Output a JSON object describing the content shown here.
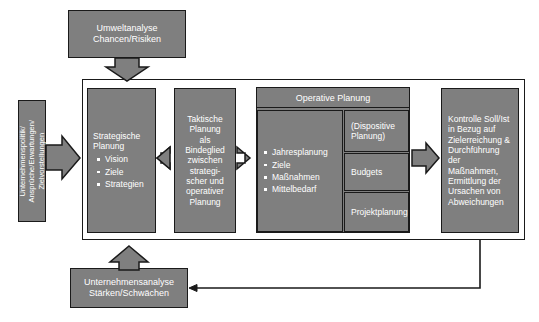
{
  "diagram": {
    "title_top": "Umweltanalyse Chancen/Risiken",
    "top_box": {
      "line1": "Umweltanalyse",
      "line2": "Chancen/Risiken"
    },
    "left_vertical_box": {
      "line1": "Unternehmenspolitik/",
      "line2": "Ansprüche/Erwartungen/",
      "line3": "Zielvorstellungen"
    },
    "strategic_box": {
      "heading_line1": "Strategische",
      "heading_line2": "Planung",
      "bullets": [
        "Vision",
        "Ziele",
        "Strategien"
      ]
    },
    "tactical_box": {
      "lines": [
        "Taktische",
        "Planung",
        "als",
        "Bindeglied",
        "zwischen",
        "strategi-",
        "scher und",
        "operativer",
        "Planung"
      ]
    },
    "operative": {
      "header": "Operative Planung",
      "bullets": [
        "Jahresplanung",
        "Ziele",
        "Maßnahmen",
        "Mittelbedarf"
      ],
      "side_boxes": [
        {
          "line1": "(Dispositive",
          "line2": "Planung)"
        },
        {
          "line1": "Budgets",
          "line2": ""
        },
        {
          "line1": "Projektplanung",
          "line2": ""
        }
      ]
    },
    "control_box": {
      "lines": [
        "Kontrolle Soll/Ist",
        "in Bezug auf",
        "Zielerreichung &",
        "Durchführung",
        "der Maßnahmen,",
        "Ermittlung der",
        "Ursachen von",
        "Abweichungen"
      ]
    },
    "bottom_box": {
      "line1": "Unternehmensanalyse",
      "line2": "Stärken/Schwächen"
    },
    "colors": {
      "fill": "#7f7f7f",
      "stroke": "#1a1a1a",
      "text": "#ffffff",
      "background": "#ffffff"
    }
  }
}
